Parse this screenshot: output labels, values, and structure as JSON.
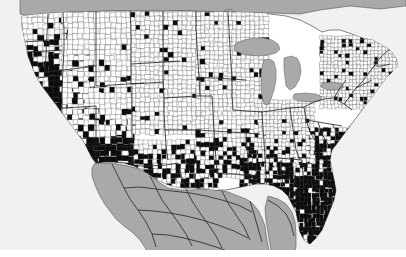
{
  "figure": {
    "kind": "choropleth-map",
    "title": "",
    "subtitle": "",
    "caption": "",
    "width_px": 406,
    "height_px": 257
  },
  "map": {
    "name": "united-states-county-choropleth",
    "region": "Contiguous United States (lower 48)",
    "projection_look": "albers-equal-area-conic",
    "geography_level": "county",
    "neighbors_shown": [
      "Canada",
      "Mexico"
    ],
    "water_shown": [
      "Pacific Ocean",
      "Atlantic Ocean",
      "Gulf of Mexico",
      "Great Lakes"
    ],
    "cropped_edges": [
      "top",
      "bottom"
    ]
  },
  "legend": {
    "visible": false,
    "classes": [
      {
        "id": "present",
        "label": "",
        "color": "#0b0b0b",
        "description": "county shaded black"
      },
      {
        "id": "absent",
        "label": "",
        "color": "#ffffff",
        "description": "county left white"
      }
    ]
  },
  "colors": {
    "high_fill": "#0b0b0b",
    "low_fill": "#ffffff",
    "county_border": "#3c3c3c",
    "state_border": "#2a2a2a",
    "ocean": "#f1f1f1",
    "foreign_land": "#a9a9a9",
    "lake": "#a9a9a9",
    "page_background": "#ffffff"
  },
  "chart_data": {
    "type": "heatmap",
    "title": "",
    "xlabel": "",
    "ylabel": "",
    "value_type": "binary",
    "categories": [
      "absent",
      "present"
    ],
    "regional_density": [
      {
        "region": "Pacific Northwest (WA, OR, N. ID)",
        "share_shaded": 0.3,
        "note": "mostly white with scattered black clusters along the Cascades and coast"
      },
      {
        "region": "California",
        "share_shaded": 0.85,
        "note": "nearly solid black, a few white interior counties"
      },
      {
        "region": "Great Basin (NV, UT)",
        "share_shaded": 0.7,
        "note": "large black blocks, white in central Utah"
      },
      {
        "region": "Arizona / New Mexico",
        "share_shaded": 0.9,
        "note": "almost entirely black, very large counties"
      },
      {
        "region": "Rocky Mountains (MT, WY, CO)",
        "share_shaded": 0.12,
        "note": "predominantly white, a few isolated black counties"
      },
      {
        "region": "Northern Plains (ND, SD, NE, KS)",
        "share_shaded": 0.04,
        "note": "essentially all white"
      },
      {
        "region": "Upper Midwest (MN, WI, MI, IA)",
        "share_shaded": 0.05,
        "note": "white, a few specks"
      },
      {
        "region": "Texas",
        "share_shaded": 0.5,
        "note": "strong checkerboard of black and white counties, denser black in the south and east"
      },
      {
        "region": "Oklahoma / Arkansas / Missouri",
        "share_shaded": 0.35,
        "note": "patchy black, increasing toward the south"
      },
      {
        "region": "Deep South (LA, MS, AL, GA)",
        "share_shaded": 0.75,
        "note": "dense black with white islands"
      },
      {
        "region": "Florida",
        "share_shaded": 0.95,
        "note": "virtually the whole peninsula black"
      },
      {
        "region": "Carolinas / Coastal Virginia",
        "share_shaded": 0.65,
        "note": "black along the coastal plain, white inland"
      },
      {
        "region": "Appalachia / Ohio Valley",
        "share_shaded": 0.1,
        "note": "mostly white, scattered black"
      },
      {
        "region": "Mid-Atlantic / Northeast",
        "share_shaded": 0.08,
        "note": "mostly white, isolated black around a few metro counties"
      }
    ],
    "summary": {
      "pattern": "Shaded counties concentrate in the Southwest, the Gulf and South Atlantic coastal plain, Florida, California and south Texas; the northern interior (Plains, Upper Midwest, Northern Rockies) and the Northeast are largely unshaded.",
      "gradient_axis": "south-west and south-east high, north-central low"
    }
  }
}
